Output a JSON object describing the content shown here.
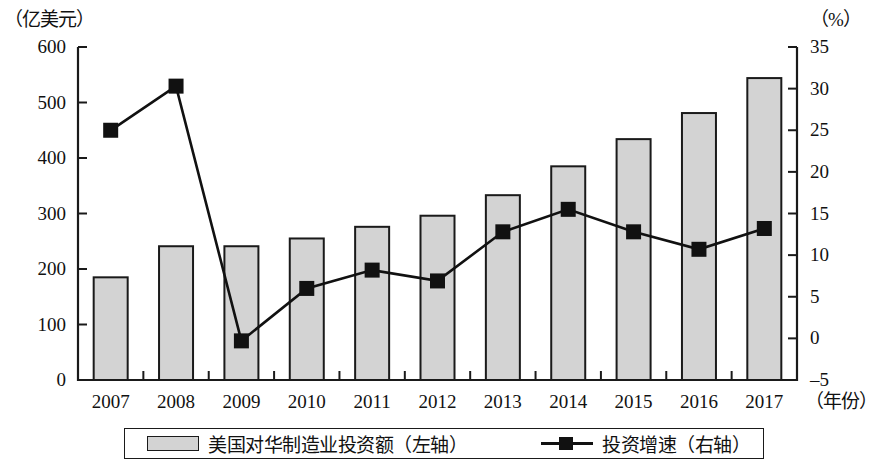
{
  "chart_data": {
    "type": "bar",
    "title": "",
    "xlabel": "年份",
    "categories": [
      "2007",
      "2008",
      "2009",
      "2010",
      "2011",
      "2012",
      "2013",
      "2014",
      "2015",
      "2016",
      "2017"
    ],
    "grid": false,
    "legend_position": "bottom",
    "series": [
      {
        "name": "美国对华制造业投资额（左轴）",
        "short_name": "美国对华制造业投资额",
        "axis": "left",
        "type": "bar",
        "unit": "亿美元",
        "color": "#d3d3d3",
        "border_color": "#1a1a1a",
        "values": [
          185,
          241,
          241,
          255,
          276,
          296,
          333,
          385,
          434,
          481,
          544
        ]
      },
      {
        "name": "投资增速（右轴）",
        "short_name": "投资增速",
        "axis": "right",
        "type": "line",
        "unit": "%",
        "color": "#111111",
        "marker": "square",
        "values": [
          25.0,
          30.3,
          -0.3,
          6.0,
          8.2,
          6.9,
          12.8,
          15.5,
          12.8,
          10.7,
          13.2
        ]
      }
    ],
    "left_axis": {
      "unit_label": "（亿美元）",
      "ticks": [
        "0",
        "100",
        "200",
        "300",
        "400",
        "500",
        "600"
      ],
      "min": 0,
      "max": 600
    },
    "right_axis": {
      "unit_label": "（%）",
      "ticks": [
        "-5",
        "0",
        "5",
        "10",
        "15",
        "20",
        "25",
        "30",
        "35"
      ],
      "min": -5,
      "max": 35
    },
    "x_axis": {
      "unit_label": "（年份）"
    },
    "legend": [
      {
        "label": "美国对华制造业投资额（左轴）",
        "swatch": "bar"
      },
      {
        "label": "投资增速（右轴）",
        "swatch": "line-marker"
      }
    ]
  }
}
